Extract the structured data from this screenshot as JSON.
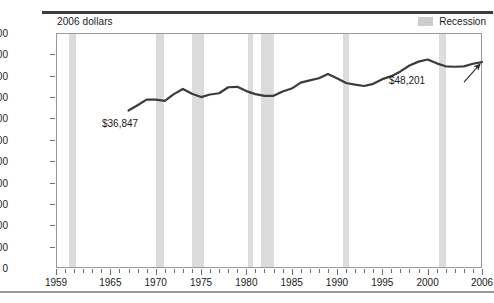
{
  "figure": {
    "unit_label": "2006 dollars",
    "legend": {
      "swatch_name": "recession-swatch",
      "label": "Recession",
      "color": "#d6d6d6"
    },
    "line_color": "#3b3b3b",
    "annotations": [
      {
        "name": "start-value-annotation",
        "text": "$36,847",
        "year": 1967,
        "value": 36847
      },
      {
        "name": "end-value-annotation",
        "text": "$48,201",
        "year": 2006,
        "value": 48201
      }
    ]
  },
  "chart_data": {
    "type": "line",
    "title": "",
    "subtitle": "",
    "xlabel": "",
    "ylabel": "2006 dollars",
    "xlim": [
      1959,
      2006
    ],
    "ylim": [
      0,
      55000
    ],
    "grid": false,
    "legend_position": "top-right",
    "y_ticks": [
      0,
      5000,
      10000,
      15000,
      20000,
      25000,
      30000,
      35000,
      40000,
      45000,
      50000,
      55000
    ],
    "y_tick_labels": [
      "0",
      "5,000",
      "10,000",
      "15,000",
      "20,000",
      "25,000",
      "30,000",
      "35,000",
      "40,000",
      "45,000",
      "50,000",
      "55,000"
    ],
    "x_tick_labels": [
      "1959",
      "1965",
      "1970",
      "1975",
      "1980",
      "1985",
      "1990",
      "1995",
      "2000",
      "2006"
    ],
    "x_tick_label_years": [
      1959,
      1965,
      1970,
      1975,
      1980,
      1985,
      1990,
      1995,
      2000,
      2006
    ],
    "x_minor_tick_years": [
      1959,
      1960,
      1961,
      1962,
      1963,
      1964,
      1965,
      1966,
      1967,
      1968,
      1969,
      1970,
      1971,
      1972,
      1973,
      1974,
      1975,
      1976,
      1977,
      1978,
      1979,
      1980,
      1981,
      1982,
      1983,
      1984,
      1985,
      1986,
      1987,
      1988,
      1989,
      1990,
      1991,
      1992,
      1993,
      1994,
      1995,
      1996,
      1997,
      1998,
      1999,
      2000,
      2001,
      2002,
      2003,
      2004,
      2005,
      2006
    ],
    "series": [
      {
        "name": "Median household income",
        "color": "#3b3b3b",
        "x": [
          1967,
          1968,
          1969,
          1970,
          1971,
          1972,
          1973,
          1974,
          1975,
          1976,
          1977,
          1978,
          1979,
          1980,
          1981,
          1982,
          1983,
          1984,
          1985,
          1986,
          1987,
          1988,
          1989,
          1990,
          1991,
          1992,
          1993,
          1994,
          1995,
          1996,
          1997,
          1998,
          1999,
          2000,
          2001,
          2002,
          2003,
          2004,
          2005,
          2006
        ],
        "y": [
          36847,
          38100,
          39400,
          39400,
          39100,
          40700,
          41900,
          40800,
          40000,
          40600,
          40900,
          42300,
          42400,
          41400,
          40700,
          40300,
          40300,
          41300,
          42000,
          43400,
          43900,
          44400,
          45400,
          44400,
          43300,
          42900,
          42600,
          43100,
          44200,
          44900,
          46000,
          47400,
          48300,
          48800,
          47900,
          47200,
          47100,
          47200,
          47800,
          48201
        ]
      }
    ],
    "recession_bands": [
      {
        "start": 1960.3,
        "end": 1961.1
      },
      {
        "start": 1969.9,
        "end": 1970.8
      },
      {
        "start": 1973.9,
        "end": 1975.2
      },
      {
        "start": 1980.1,
        "end": 1980.6
      },
      {
        "start": 1981.5,
        "end": 1982.9
      },
      {
        "start": 1990.6,
        "end": 1991.2
      },
      {
        "start": 2001.2,
        "end": 2001.9
      }
    ]
  }
}
